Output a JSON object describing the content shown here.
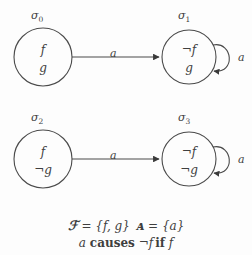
{
  "diagram": {
    "states": [
      {
        "id": "sigma0",
        "name_base": "σ",
        "name_sub": "0",
        "fluents": [
          "f",
          "g"
        ],
        "cx": 43,
        "cy": 57,
        "r": 29,
        "self_loop": false
      },
      {
        "id": "sigma1",
        "name_base": "σ",
        "name_sub": "1",
        "fluents": [
          "¬f",
          "g"
        ],
        "cx": 189,
        "cy": 57,
        "r": 27,
        "self_loop": true,
        "loop_label": "a"
      },
      {
        "id": "sigma2",
        "name_base": "σ",
        "name_sub": "2",
        "fluents": [
          "f",
          "¬g"
        ],
        "cx": 43,
        "cy": 159,
        "r": 29,
        "self_loop": false
      },
      {
        "id": "sigma3",
        "name_base": "σ",
        "name_sub": "3",
        "fluents": [
          "¬f",
          "¬g"
        ],
        "cx": 189,
        "cy": 159,
        "r": 27,
        "self_loop": true,
        "loop_label": "a"
      }
    ],
    "transitions": [
      {
        "id": "t0",
        "from": "sigma0",
        "to": "sigma1",
        "label": "a"
      },
      {
        "id": "t1",
        "from": "sigma2",
        "to": "sigma3",
        "label": "a"
      }
    ]
  },
  "caption": {
    "fluent_symbol": "ℱ",
    "fluent_eq": " = {f, g}",
    "action_symbol": "ᴀ",
    "action_eq": " = {a}",
    "line1_full": "ℱ = {f, g}  ᴀ = {a}",
    "rule_action": "a",
    "rule_causes": "causes",
    "rule_effect": "¬f",
    "rule_if": "if",
    "rule_condition": "f",
    "line2_full": "a causes ¬f if f"
  },
  "colors": {
    "background": "#fdfdfd",
    "stroke": "#4a4a4a",
    "text": "#3f3f3f"
  }
}
